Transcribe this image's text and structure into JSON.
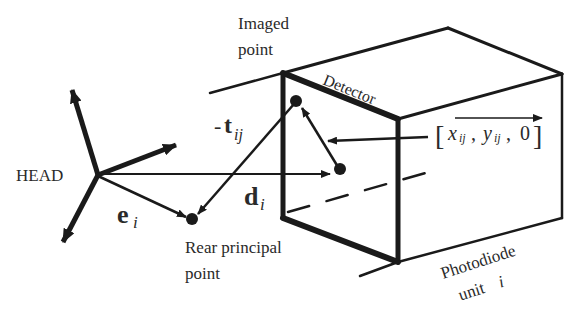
{
  "diagram": {
    "type": "geometry-schematic",
    "labels": {
      "imaged_point_line1": "Imaged",
      "imaged_point_line2": "point",
      "detector": "Detector",
      "head": "HEAD",
      "rear_principal_line1": "Rear principal",
      "rear_principal_line2": "point",
      "photodiode_line1": "Photodiode",
      "photodiode_line2": "unit",
      "photodiode_index": "i"
    },
    "vectors": {
      "t": {
        "prefix": "-",
        "symbol": "t",
        "subscript": "ij"
      },
      "d": {
        "symbol": "d",
        "subscript": "i"
      },
      "e": {
        "symbol": "e",
        "subscript": "i"
      }
    },
    "coordinate": {
      "open": "[",
      "x": "x",
      "x_sub": "ij",
      "sep1": ",",
      "y": "y",
      "y_sub": "ij",
      "sep2": ",",
      "z": "0",
      "close": "]"
    },
    "colors": {
      "ink": "#1a1a1a",
      "background": "#ffffff"
    }
  }
}
